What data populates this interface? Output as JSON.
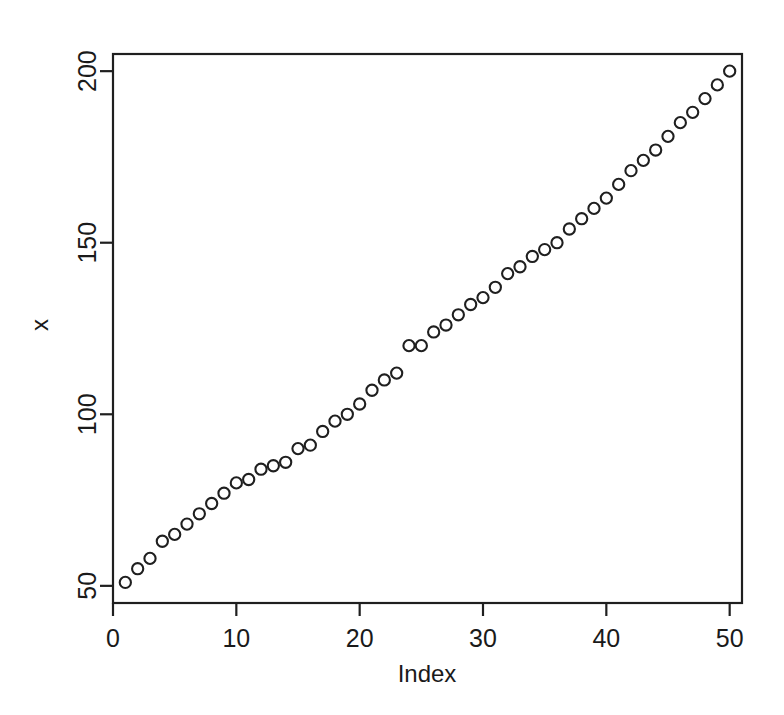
{
  "chart_data": {
    "type": "scatter",
    "title": "",
    "xlabel": "Index",
    "ylabel": "x",
    "xlim": [
      0,
      51
    ],
    "ylim": [
      45,
      205
    ],
    "xticks": [
      0,
      10,
      20,
      30,
      40,
      50
    ],
    "yticks": [
      50,
      100,
      150,
      200
    ],
    "xtick_labels": [
      "0",
      "10",
      "20",
      "30",
      "40",
      "50"
    ],
    "ytick_labels": [
      "50",
      "100",
      "150",
      "200"
    ],
    "grid": false,
    "legend": null,
    "marker": "open-circle",
    "marker_color": "#1f1f1f",
    "frame": true,
    "n_points": 50,
    "x": [
      1,
      2,
      3,
      4,
      5,
      6,
      7,
      8,
      9,
      10,
      11,
      12,
      13,
      14,
      15,
      16,
      17,
      18,
      19,
      20,
      21,
      22,
      23,
      24,
      25,
      26,
      27,
      28,
      29,
      30,
      31,
      32,
      33,
      34,
      35,
      36,
      37,
      38,
      39,
      40,
      41,
      42,
      43,
      44,
      45,
      46,
      47,
      48,
      49,
      50
    ],
    "values": [
      51,
      55,
      58,
      63,
      65,
      68,
      71,
      74,
      77,
      80,
      81,
      84,
      85,
      86,
      90,
      91,
      95,
      98,
      100,
      103,
      107,
      110,
      112,
      120,
      120,
      124,
      126,
      129,
      132,
      134,
      137,
      141,
      143,
      146,
      148,
      150,
      154,
      157,
      160,
      163,
      167,
      171,
      174,
      177,
      181,
      185,
      188,
      192,
      196,
      200
    ]
  },
  "axis": {
    "x_title": "Index",
    "y_title": "x"
  }
}
